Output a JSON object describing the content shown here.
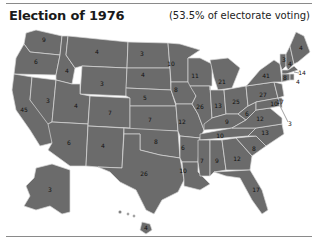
{
  "header": {
    "title": "Election of 1976",
    "subtitle": "(53.5% of electorate voting)"
  },
  "map": {
    "fill_color": "#6b6b6b",
    "border_color": "#d8d8d8",
    "electoral_votes": {
      "WA": "9",
      "OR": "6",
      "CA": "45",
      "ID": "4",
      "NV": "3",
      "MT": "4",
      "WY": "3",
      "UT": "4",
      "AZ": "6",
      "CO": "7",
      "NM": "4",
      "ND": "3",
      "SD": "4",
      "NE": "5",
      "KS": "7",
      "OK": "8",
      "TX": "26",
      "MN": "10",
      "IA": "8",
      "MO": "12",
      "AR": "6",
      "LA": "10",
      "WI": "11",
      "IL": "26",
      "MI": "21",
      "IN": "13",
      "OH": "25",
      "KY": "9",
      "TN": "10",
      "MS": "7",
      "AL": "9",
      "GA": "12",
      "FL": "17",
      "SC": "8",
      "NC": "13",
      "VA": "12",
      "WV": "6",
      "PA": "27",
      "NY": "41",
      "VT": "3",
      "NH": "4",
      "ME": "4",
      "MA": "14",
      "RI": "4",
      "CT": "8",
      "NJ": "17",
      "DE": "3",
      "MD": "10",
      "AK": "3",
      "HI": "4",
      "DC": "3"
    }
  }
}
